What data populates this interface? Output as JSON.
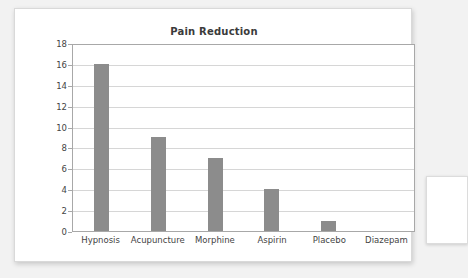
{
  "card": {
    "title": "Pain Reduction"
  },
  "chart_data": {
    "type": "bar",
    "title": "Pain Reduction",
    "xlabel": "",
    "ylabel": "",
    "categories": [
      "Hypnosis",
      "Acupuncture",
      "Morphine",
      "Aspirin",
      "Placebo",
      "Diazepam"
    ],
    "values": [
      16,
      9,
      7,
      4,
      1,
      0
    ],
    "ylim": [
      0,
      18
    ],
    "yticks": [
      0,
      2,
      4,
      6,
      8,
      10,
      12,
      14,
      16,
      18
    ],
    "grid": true,
    "legend": false,
    "bar_color": "#8c8c8c",
    "gridline_color": "#d6d6d6",
    "axis_color": "#a8a8a8",
    "title_color": "#3b3b3b",
    "label_color": "#444444",
    "background_color": "#ffffff",
    "page_background_color": "#f2f2f2"
  }
}
